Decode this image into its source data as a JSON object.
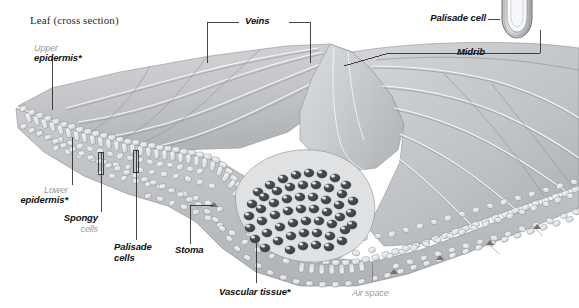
{
  "figure": {
    "title": "Leaf (cross section)",
    "background_color": "#ffffff",
    "ink_color": "#111111",
    "secondary_text_color": "#9a9a9a",
    "leaf_surface_color": "#c6c8ca",
    "cell_fill_color": "#e9eaec",
    "vascular_tissue_color": "#3a3c3f"
  },
  "labels": {
    "veins": "Veins",
    "palisade_cell_inset": "Palisade cell",
    "midrib": "Midrib",
    "upper_epidermis_line1": "Upper",
    "upper_epidermis_line2": "epidermis*",
    "lower_epidermis_line1": "Lower",
    "lower_epidermis_line2": "epidermis*",
    "spongy_line1": "Spongy",
    "spongy_line2": "cells",
    "palisade_cells_line1": "Palisade",
    "palisade_cells_line2": "cells",
    "stoma": "Stoma",
    "vascular_tissue": "Vascular tissue*",
    "air_space": "Air space"
  },
  "icons": {
    "leader_line": "leader-line",
    "bracket": "bracket-connector",
    "pointer_bar": "pointer-bar"
  }
}
